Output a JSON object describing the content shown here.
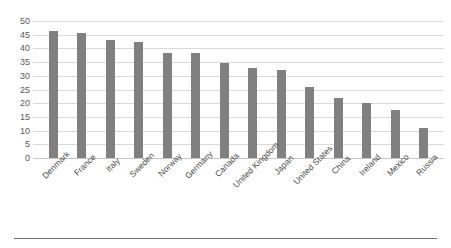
{
  "chart_data": {
    "type": "bar",
    "title": "",
    "subtitle": "",
    "xlabel": "",
    "ylabel": "",
    "ylim": [
      0,
      50
    ],
    "grid": true,
    "legend": false,
    "legend_position": "none",
    "bar_color": "#808080",
    "gridline_color": "#d9d9d9",
    "categories": [
      "Denmark",
      "France",
      "Italy",
      "Sweden",
      "Norway",
      "Germany",
      "Canada",
      "United Kingdom",
      "Japan",
      "United States",
      "China",
      "Ireland",
      "Mexico",
      "Russia"
    ],
    "values": [
      46.5,
      45.5,
      43,
      42.5,
      38.5,
      38.5,
      34.5,
      33,
      32,
      26,
      22,
      20,
      17.5,
      11
    ],
    "yticks": [
      0,
      5,
      10,
      15,
      20,
      25,
      30,
      35,
      40,
      45,
      50
    ],
    "ytick_labels": [
      "0",
      "5",
      "10",
      "15",
      "20",
      "25",
      "30",
      "35",
      "40",
      "45",
      "50"
    ]
  }
}
